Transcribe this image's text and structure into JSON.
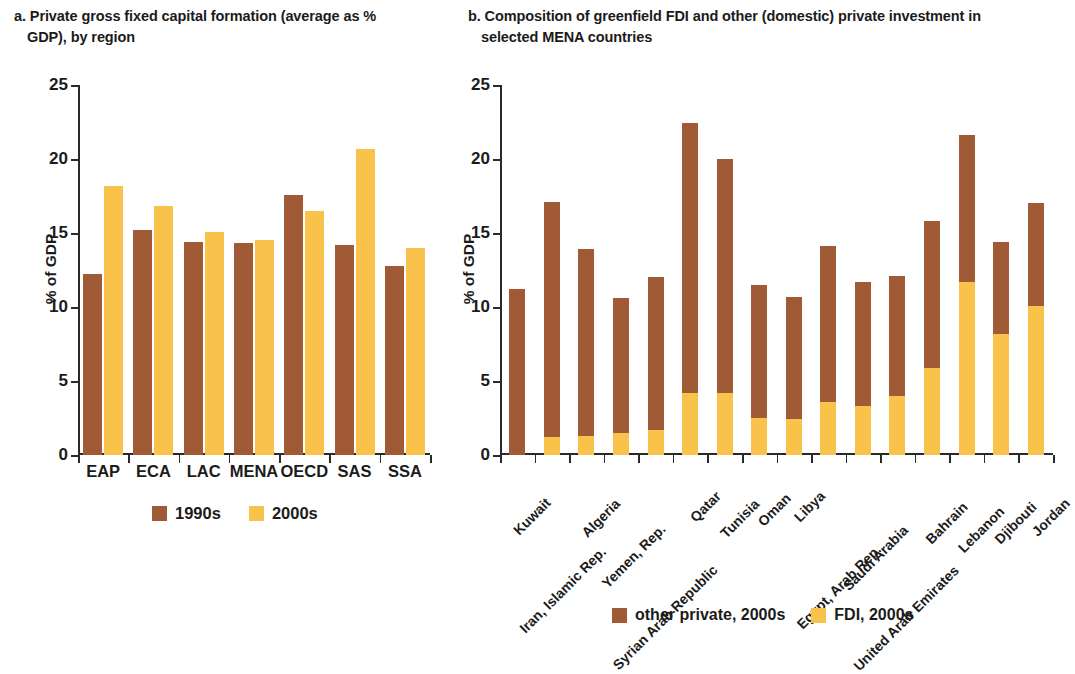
{
  "colors": {
    "brown": "#A05A36",
    "yellow": "#F8C24B",
    "axis": "#2a2a2a",
    "text": "#1b1b1b"
  },
  "panel_a": {
    "title_line1": "a. Private gross fixed capital formation (average as %",
    "title_line2": "GDP), by region",
    "ylabel": "% of GDP",
    "legend": [
      {
        "label": "1990s",
        "color": "#A05A36"
      },
      {
        "label": "2000s",
        "color": "#F8C24B"
      }
    ]
  },
  "panel_b": {
    "title_line1": "b. Composition of greenfield FDI and other (domestic) private investment in",
    "title_line2": "selected MENA countries",
    "ylabel": "% of GDP",
    "legend": [
      {
        "label": "other private, 2000s",
        "color": "#A05A36"
      },
      {
        "label": "FDI, 2000s",
        "color": "#F8C24B"
      }
    ]
  },
  "chart_data": [
    {
      "id": "a",
      "type": "bar",
      "title": "a. Private gross fixed capital formation (average as % GDP), by region",
      "xlabel": "",
      "ylabel": "% of GDP",
      "ylim": [
        0,
        25
      ],
      "yticks": [
        0,
        5,
        10,
        15,
        20,
        25
      ],
      "grid": false,
      "legend_position": "bottom",
      "grouping": "grouped",
      "categories": [
        "EAP",
        "ECA",
        "LAC",
        "MENA",
        "OECD",
        "SAS",
        "SSA"
      ],
      "series": [
        {
          "name": "1990s",
          "color": "#A05A36",
          "values": [
            12.2,
            15.2,
            14.4,
            14.3,
            17.6,
            14.2,
            12.8
          ]
        },
        {
          "name": "2000s",
          "color": "#F8C24B",
          "values": [
            18.2,
            16.8,
            15.1,
            14.5,
            16.5,
            20.7,
            14.0
          ]
        }
      ]
    },
    {
      "id": "b",
      "type": "bar",
      "title": "b. Composition of greenfield FDI and other (domestic) private investment in selected MENA countries",
      "xlabel": "",
      "ylabel": "% of GDP",
      "ylim": [
        0,
        25
      ],
      "yticks": [
        0,
        5,
        10,
        15,
        20,
        25
      ],
      "grid": false,
      "legend_position": "bottom",
      "grouping": "stacked",
      "categories": [
        "Kuwait",
        "Iran, Islamic Rep.",
        "Algeria",
        "Yemen, Rep.",
        "Syrian Arab Republic",
        "Qatar",
        "Tunisia",
        "Oman",
        "Libya",
        "Egypt, Arab Rep.",
        "Saudi Arabia",
        "United Arab Emirates",
        "Bahrain",
        "Lebanon",
        "Djibouti",
        "Jordan"
      ],
      "series": [
        {
          "name": "FDI, 2000s",
          "color": "#F8C24B",
          "values": [
            0.0,
            1.2,
            1.3,
            1.5,
            1.7,
            4.2,
            4.2,
            2.5,
            2.4,
            3.6,
            3.3,
            4.0,
            5.9,
            11.7,
            8.2,
            10.1
          ]
        },
        {
          "name": "other private, 2000s",
          "color": "#A05A36",
          "values": [
            11.2,
            15.9,
            12.6,
            9.1,
            10.3,
            18.2,
            15.8,
            9.0,
            8.3,
            10.5,
            8.4,
            8.1,
            9.9,
            9.9,
            6.2,
            6.9
          ]
        }
      ],
      "totals": [
        11.2,
        17.1,
        13.9,
        10.6,
        12.0,
        22.4,
        20.0,
        11.5,
        10.7,
        14.1,
        11.7,
        12.1,
        15.8,
        21.6,
        14.4,
        17.0
      ]
    }
  ]
}
